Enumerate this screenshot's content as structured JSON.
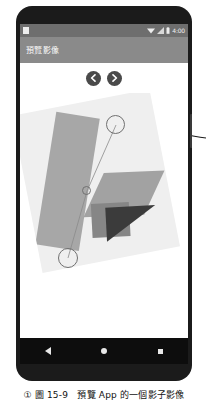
{
  "figure": {
    "caption_marker": "①",
    "caption_text": "圖 15-9　預覽 App 的一個影子影像"
  },
  "annotation": {
    "arrow_name": "callout-arrow-to-marker"
  },
  "phone": {
    "status_bar": {
      "app_icon": "app-icon",
      "wifi_icon": "wifi-icon",
      "signal_icon": "signal-icon",
      "battery_icon": "battery-icon",
      "clock": "4:00"
    },
    "app_bar": {
      "title": "預覽影像"
    },
    "nav_buttons": [
      {
        "name": "previous-image-button",
        "glyph": "‹"
      },
      {
        "name": "next-image-button",
        "glyph": "›"
      }
    ],
    "content": {
      "photo_alt": "rotated-geometric-photo",
      "markers": [
        {
          "name": "marker-top",
          "label": ""
        },
        {
          "name": "marker-middle",
          "label": ""
        },
        {
          "name": "marker-bottom",
          "label": ""
        }
      ]
    },
    "system_nav": {
      "back": "back-button",
      "home": "home-button",
      "recents": "recents-button"
    }
  },
  "colors": {
    "status_bar": "#6e6e6e",
    "app_bar": "#8a8a8a",
    "device_frame": "#1b1b1b",
    "nav_bar": "#0d0d0d",
    "photo_bg": "#efefef"
  }
}
